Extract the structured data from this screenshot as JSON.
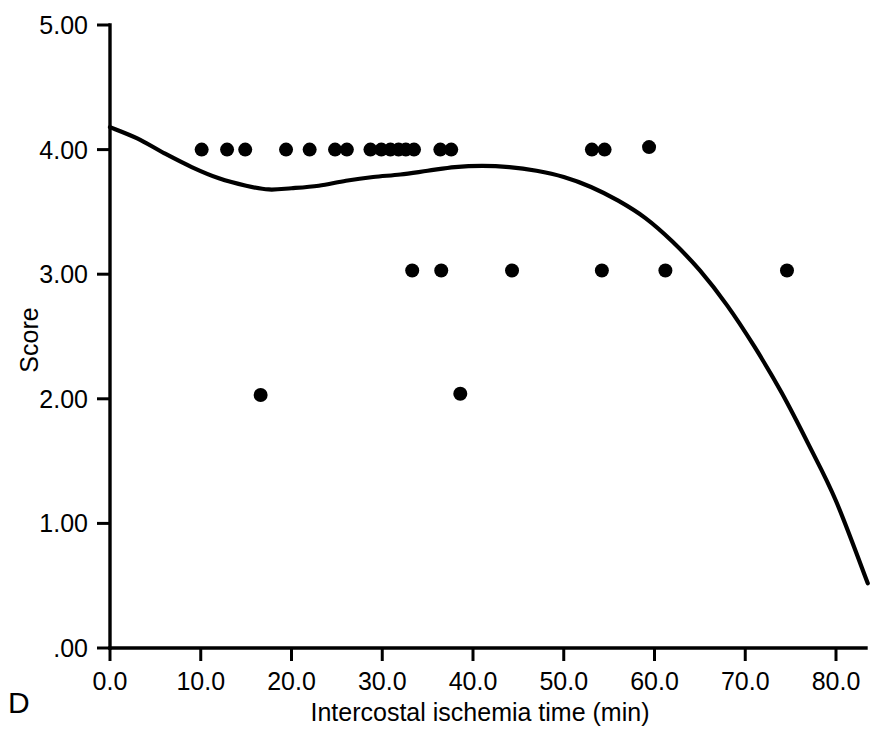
{
  "panel": {
    "label": "D"
  },
  "chart_data": {
    "type": "scatter",
    "title": "",
    "subtitle": "",
    "xlabel": "Intercostal ischemia time (min)",
    "ylabel": "Score",
    "xlim": [
      0.0,
      84.0
    ],
    "ylim": [
      0.0,
      5.0
    ],
    "xticks": [
      0.0,
      10.0,
      20.0,
      30.0,
      40.0,
      50.0,
      60.0,
      70.0,
      80.0
    ],
    "xtick_labels": [
      "0.0",
      "10.0",
      "20.0",
      "30.0",
      "40.0",
      "50.0",
      "60.0",
      "70.0",
      "80.0"
    ],
    "yticks": [
      0.0,
      1.0,
      2.0,
      3.0,
      4.0,
      5.0
    ],
    "ytick_labels": [
      ".00",
      "1.00",
      "2.00",
      "3.00",
      "4.00",
      "5.00"
    ],
    "grid": false,
    "legend": false,
    "marker": "filled-circle",
    "marker_color": "#000000",
    "marker_size_px": 14,
    "points": [
      {
        "x": 10.1,
        "y": 4.0
      },
      {
        "x": 12.9,
        "y": 4.0
      },
      {
        "x": 14.9,
        "y": 4.0
      },
      {
        "x": 19.4,
        "y": 4.0
      },
      {
        "x": 22.0,
        "y": 4.0
      },
      {
        "x": 24.8,
        "y": 4.0
      },
      {
        "x": 26.1,
        "y": 4.0
      },
      {
        "x": 28.7,
        "y": 4.0
      },
      {
        "x": 29.9,
        "y": 4.0
      },
      {
        "x": 30.9,
        "y": 4.0
      },
      {
        "x": 31.8,
        "y": 4.0
      },
      {
        "x": 32.6,
        "y": 4.0
      },
      {
        "x": 33.5,
        "y": 4.0
      },
      {
        "x": 36.4,
        "y": 4.0
      },
      {
        "x": 37.6,
        "y": 4.0
      },
      {
        "x": 53.1,
        "y": 4.0
      },
      {
        "x": 54.5,
        "y": 4.0
      },
      {
        "x": 59.4,
        "y": 4.02
      },
      {
        "x": 33.3,
        "y": 3.03
      },
      {
        "x": 36.5,
        "y": 3.03
      },
      {
        "x": 44.3,
        "y": 3.03
      },
      {
        "x": 54.2,
        "y": 3.03
      },
      {
        "x": 61.2,
        "y": 3.03
      },
      {
        "x": 74.6,
        "y": 3.03
      },
      {
        "x": 16.6,
        "y": 2.03
      },
      {
        "x": 38.6,
        "y": 2.04
      }
    ],
    "fit_curve": {
      "name": "lowess-fit",
      "style": "solid-black-line",
      "points": [
        {
          "x": 0.0,
          "y": 4.18
        },
        {
          "x": 3.0,
          "y": 4.09
        },
        {
          "x": 6.0,
          "y": 3.97
        },
        {
          "x": 9.0,
          "y": 3.86
        },
        {
          "x": 12.0,
          "y": 3.77
        },
        {
          "x": 15.0,
          "y": 3.71
        },
        {
          "x": 17.5,
          "y": 3.68
        },
        {
          "x": 20.0,
          "y": 3.69
        },
        {
          "x": 23.0,
          "y": 3.71
        },
        {
          "x": 26.0,
          "y": 3.75
        },
        {
          "x": 29.0,
          "y": 3.78
        },
        {
          "x": 32.0,
          "y": 3.8
        },
        {
          "x": 35.0,
          "y": 3.83
        },
        {
          "x": 38.0,
          "y": 3.86
        },
        {
          "x": 41.0,
          "y": 3.87
        },
        {
          "x": 44.0,
          "y": 3.86
        },
        {
          "x": 47.0,
          "y": 3.83
        },
        {
          "x": 50.0,
          "y": 3.78
        },
        {
          "x": 53.0,
          "y": 3.7
        },
        {
          "x": 56.0,
          "y": 3.59
        },
        {
          "x": 59.0,
          "y": 3.45
        },
        {
          "x": 62.0,
          "y": 3.26
        },
        {
          "x": 65.0,
          "y": 3.03
        },
        {
          "x": 68.0,
          "y": 2.75
        },
        {
          "x": 71.0,
          "y": 2.42
        },
        {
          "x": 74.0,
          "y": 2.05
        },
        {
          "x": 77.0,
          "y": 1.63
        },
        {
          "x": 80.0,
          "y": 1.18
        },
        {
          "x": 83.5,
          "y": 0.52
        }
      ]
    }
  }
}
